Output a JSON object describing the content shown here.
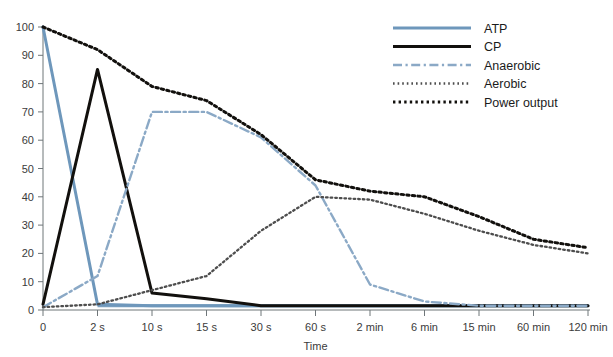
{
  "chart_data": {
    "type": "line",
    "title": "",
    "subtitle": "",
    "xlabel": "Time",
    "ylabel": "",
    "grid": false,
    "legend_position": "top-right",
    "x": [
      "0",
      "2 s",
      "10 s",
      "15 s",
      "30 s",
      "60 s",
      "2 min",
      "6 min",
      "15 min",
      "60 min",
      "120 min"
    ],
    "xtick_labels": [
      "0",
      "2 s",
      "10 s",
      "15 s",
      "30 s",
      "60 s",
      "2 min",
      "6 min",
      "15 min",
      "60 min",
      "120 min"
    ],
    "ytick_labels": [
      "0",
      "10",
      "20",
      "30",
      "40",
      "50",
      "60",
      "70",
      "80",
      "90",
      "100"
    ],
    "ylim": [
      0,
      100
    ],
    "ytick_step": 10,
    "series": [
      {
        "name": "ATP",
        "style": "solid",
        "color": "#6e97bb",
        "values": [
          100,
          2,
          1.5,
          1.5,
          1.5,
          1.5,
          1.5,
          1.5,
          1.5,
          1.5,
          1.5
        ]
      },
      {
        "name": "CP",
        "style": "solid",
        "color": "#12100d",
        "values": [
          2,
          85,
          6,
          4,
          1.5,
          1.5,
          1.5,
          1.5,
          1.5,
          1.5,
          1.5
        ]
      },
      {
        "name": "Anaerobic",
        "style": "dash-dot",
        "color": "#8ba9c6",
        "values": [
          1,
          12,
          70,
          70,
          61,
          44,
          9,
          3,
          1.5,
          1.5,
          1.5
        ]
      },
      {
        "name": "Aerobic",
        "style": "fine-dotted",
        "color": "#4d4d4d",
        "values": [
          1,
          2,
          7,
          12,
          28,
          40,
          39,
          34,
          28,
          23,
          20
        ]
      },
      {
        "name": "Power output",
        "style": "bold-dotted",
        "color": "#12100d",
        "values": [
          100,
          92,
          79,
          74,
          62,
          46,
          42,
          40,
          33,
          25,
          22
        ]
      }
    ]
  },
  "legend": {
    "entries": [
      {
        "label": "ATP"
      },
      {
        "label": "CP"
      },
      {
        "label": "Anaerobic"
      },
      {
        "label": "Aerobic"
      },
      {
        "label": "Power output"
      }
    ]
  },
  "axes": {
    "x_title": "Time"
  }
}
